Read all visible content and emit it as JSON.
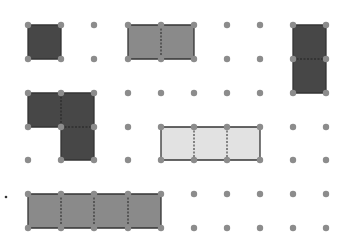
{
  "figure": {
    "title": "",
    "width": 340,
    "height": 246,
    "background": "#ffffff"
  },
  "grid": {
    "columns_x": [
      28,
      61,
      94,
      128,
      161,
      194,
      227,
      260,
      293,
      326
    ],
    "rows_y": [
      25,
      59,
      93,
      127,
      160,
      194,
      228
    ],
    "dot_radius": 3.2,
    "dot_color": "#8c8c8c"
  },
  "colors": {
    "dark": "#474747",
    "medium": "#8a8a8a",
    "light": "#e2e2e2",
    "stroke": "#333333",
    "divider": "#222222"
  },
  "shapes": [
    {
      "name": "unit-square-dark",
      "fill": "dark",
      "cells": [
        [
          0,
          0
        ]
      ]
    },
    {
      "name": "two-cell-horizontal-medium",
      "fill": "medium",
      "cells": [
        [
          3,
          0
        ],
        [
          4,
          0
        ]
      ]
    },
    {
      "name": "two-cell-vertical-dark",
      "fill": "dark",
      "cells": [
        [
          8,
          0
        ],
        [
          8,
          1
        ]
      ]
    },
    {
      "name": "l-shape-three-cells-dark",
      "fill": "dark",
      "cells": [
        [
          0,
          2
        ],
        [
          1,
          2
        ],
        [
          1,
          3
        ]
      ]
    },
    {
      "name": "three-cell-horizontal-light",
      "fill": "light",
      "cells": [
        [
          4,
          3
        ],
        [
          5,
          3
        ],
        [
          6,
          3
        ]
      ]
    },
    {
      "name": "four-cell-horizontal-medium",
      "fill": "medium",
      "cells": [
        [
          0,
          5
        ],
        [
          1,
          5
        ],
        [
          2,
          5
        ],
        [
          3,
          5
        ]
      ]
    }
  ],
  "marker": {
    "name": "list-bullet-dot",
    "x": 6,
    "y": 197,
    "r": 1.3,
    "color": "#333333"
  }
}
